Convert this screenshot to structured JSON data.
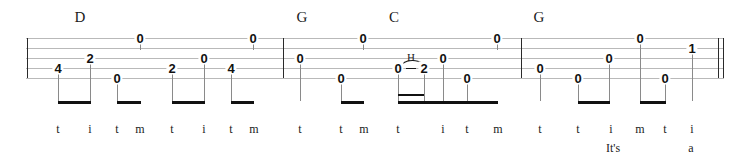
{
  "notation": {
    "type": "tablature",
    "instrument": "banjo",
    "string_count": 5,
    "staff": {
      "left": 26,
      "right": 724,
      "top": 38,
      "bottom": 78,
      "line_spacing": 10,
      "line_color": "#b9b9b9"
    },
    "barlines": [
      {
        "name": "start-barline",
        "x": 27,
        "style": "single"
      },
      {
        "name": "barline-1",
        "x": 283,
        "style": "single"
      },
      {
        "name": "barline-2",
        "x": 521,
        "style": "single"
      },
      {
        "name": "end-barline-thin",
        "x": 718,
        "style": "single"
      },
      {
        "name": "end-barline-thick",
        "x": 723,
        "style": "single"
      }
    ],
    "chords": [
      {
        "label": "D",
        "x": 80,
        "y": 10
      },
      {
        "label": "G",
        "x": 302,
        "y": 10
      },
      {
        "label": "C",
        "x": 394,
        "y": 10
      },
      {
        "label": "G",
        "x": 539,
        "y": 10
      }
    ],
    "notes": [
      {
        "fret": "4",
        "string": 4,
        "x": 58,
        "stem_bottom": 101
      },
      {
        "fret": "2",
        "string": 3,
        "x": 90,
        "stem_bottom": 101
      },
      {
        "fret": "0",
        "string": 1,
        "x": 140,
        "stem_bottom": 50
      },
      {
        "fret": "0",
        "string": 5,
        "x": 117,
        "stem_bottom": 101
      },
      {
        "fret": "2",
        "string": 4,
        "x": 172,
        "stem_bottom": 101
      },
      {
        "fret": "0",
        "string": 3,
        "x": 204,
        "stem_bottom": 101
      },
      {
        "fret": "0",
        "string": 1,
        "x": 253,
        "stem_bottom": 50
      },
      {
        "fret": "4",
        "string": 4,
        "x": 231,
        "stem_bottom": 101
      },
      {
        "fret": "0",
        "string": 3,
        "x": 300,
        "stem_bottom": 101
      },
      {
        "fret": "0",
        "string": 5,
        "x": 341,
        "stem_bottom": 101
      },
      {
        "fret": "0",
        "string": 1,
        "x": 363,
        "stem_bottom": 50
      },
      {
        "fret": "0",
        "string": 4,
        "x": 398,
        "stem_bottom": 101
      },
      {
        "fret": "2",
        "string": 4,
        "x": 424,
        "stem_bottom": 101
      },
      {
        "fret": "0",
        "string": 3,
        "x": 443,
        "stem_bottom": 101
      },
      {
        "fret": "0",
        "string": 5,
        "x": 467,
        "stem_bottom": 101
      },
      {
        "fret": "0",
        "string": 1,
        "x": 497,
        "stem_bottom": 50
      },
      {
        "fret": "0",
        "string": 4,
        "x": 540,
        "stem_bottom": 101
      },
      {
        "fret": "0",
        "string": 5,
        "x": 578,
        "stem_bottom": 101
      },
      {
        "fret": "0",
        "string": 3,
        "x": 609,
        "stem_bottom": 101
      },
      {
        "fret": "0",
        "string": 1,
        "x": 640,
        "stem_bottom": 101
      },
      {
        "fret": "0",
        "string": 5,
        "x": 665,
        "stem_bottom": 101
      },
      {
        "fret": "1",
        "string": 2,
        "x": 692,
        "stem_bottom": 101
      }
    ],
    "beams": [
      {
        "x": 58,
        "width": 33,
        "y": 101,
        "level": 1
      },
      {
        "x": 117,
        "width": 24,
        "y": 101,
        "level": 1
      },
      {
        "x": 172,
        "width": 33,
        "y": 101,
        "level": 1
      },
      {
        "x": 231,
        "width": 23,
        "y": 101,
        "level": 1
      },
      {
        "x": 341,
        "width": 23,
        "y": 101,
        "level": 1
      },
      {
        "x": 398,
        "width": 26,
        "y": 94,
        "level": 2
      },
      {
        "x": 398,
        "width": 70,
        "y": 101,
        "level": 1
      },
      {
        "x": 467,
        "width": 31,
        "y": 101,
        "level": 1
      },
      {
        "x": 578,
        "width": 32,
        "y": 101,
        "level": 1
      },
      {
        "x": 640,
        "width": 26,
        "y": 101,
        "level": 1
      }
    ],
    "hammer_on": {
      "symbol": "H",
      "symbol_x": 411,
      "symbol_y": 52,
      "slur_x": 398,
      "slur_y": 60,
      "slur_width": 27,
      "dash_x": 406,
      "dash_y": 68,
      "dash_width": 10
    },
    "fingering": [
      {
        "label": "t",
        "x": 58
      },
      {
        "label": "i",
        "x": 90
      },
      {
        "label": "t",
        "x": 117
      },
      {
        "label": "m",
        "x": 140
      },
      {
        "label": "t",
        "x": 172
      },
      {
        "label": "i",
        "x": 204
      },
      {
        "label": "t",
        "x": 231
      },
      {
        "label": "m",
        "x": 254
      },
      {
        "label": "t",
        "x": 300
      },
      {
        "label": "t",
        "x": 341
      },
      {
        "label": "m",
        "x": 364
      },
      {
        "label": "t",
        "x": 398
      },
      {
        "label": "i",
        "x": 443
      },
      {
        "label": "t",
        "x": 467
      },
      {
        "label": "m",
        "x": 498
      },
      {
        "label": "t",
        "x": 540
      },
      {
        "label": "t",
        "x": 578
      },
      {
        "label": "i",
        "x": 611
      },
      {
        "label": "m",
        "x": 640
      },
      {
        "label": "t",
        "x": 665
      },
      {
        "label": "i",
        "x": 692
      }
    ],
    "fingering_y": 123,
    "lyrics": [
      {
        "text": "It's",
        "x": 613
      },
      {
        "text": "a",
        "x": 691
      }
    ],
    "lyrics_y": 142
  }
}
